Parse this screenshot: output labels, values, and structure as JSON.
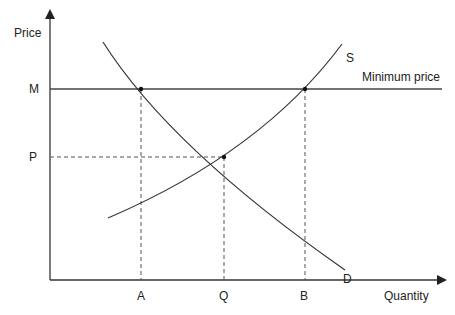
{
  "diagram": {
    "axes": {
      "y_label": "Price",
      "x_label": "Quantity"
    },
    "price_levels": [
      {
        "id": "M",
        "label": "M",
        "meaning": "minimum price"
      },
      {
        "id": "P",
        "label": "P",
        "meaning": "equilibrium price"
      }
    ],
    "quantity_levels": [
      {
        "id": "A",
        "label": "A",
        "meaning": "quantity demanded at minimum price"
      },
      {
        "id": "Q",
        "label": "Q",
        "meaning": "equilibrium quantity"
      },
      {
        "id": "B",
        "label": "B",
        "meaning": "quantity supplied at minimum price"
      }
    ],
    "curves": {
      "supply_label": "S",
      "demand_label": "D",
      "floor_label": "Minimum price"
    },
    "points": [
      {
        "name": "demand-at-minimum-price",
        "quantity": "A",
        "price": "M"
      },
      {
        "name": "equilibrium",
        "quantity": "Q",
        "price": "P"
      },
      {
        "name": "supply-at-minimum-price",
        "quantity": "B",
        "price": "M"
      }
    ],
    "colors": {
      "line": "#333333",
      "text": "#222222",
      "background": "#ffffff"
    }
  }
}
